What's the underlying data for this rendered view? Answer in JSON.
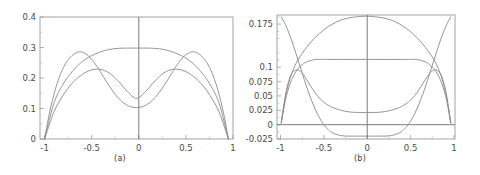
{
  "figure": {
    "background": "#ffffff",
    "panels": [
      {
        "caption": "(a)",
        "chart_data": {
          "type": "line",
          "title": "",
          "xlabel": "",
          "ylabel": "",
          "xlim": [
            -1.05,
            1.05
          ],
          "ylim": [
            0,
            0.42
          ],
          "xticks": [
            -1,
            -0.5,
            0,
            0.5,
            1
          ],
          "xtick_labels": [
            "-1",
            "-0.5",
            "0",
            "0.5",
            "1"
          ],
          "yticks": [
            0,
            0.1,
            0.2,
            0.3,
            0.4
          ],
          "ytick_labels": [
            "0",
            "0.1",
            "0.2",
            "0.3",
            "0.4"
          ],
          "grid": false,
          "legend": "none",
          "frame": true,
          "zero_axis_vertical": true,
          "series": [
            {
              "name": "single-peak dome",
              "color": "#8a8a8a",
              "x": [
                -1,
                -0.9,
                -0.8,
                -0.7,
                -0.6,
                -0.5,
                -0.4,
                -0.3,
                -0.2,
                -0.1,
                0,
                0.1,
                0.2,
                0.3,
                0.4,
                0.5,
                0.6,
                0.7,
                0.8,
                0.9,
                1
              ],
              "y": [
                0,
                0.122,
                0.188,
                0.232,
                0.264,
                0.285,
                0.299,
                0.308,
                0.312,
                0.313,
                0.313,
                0.313,
                0.312,
                0.308,
                0.299,
                0.285,
                0.264,
                0.232,
                0.188,
                0.122,
                0
              ]
            },
            {
              "name": "center-dip curve",
              "color": "#8a8a8a",
              "x": [
                -1,
                -0.9,
                -0.8,
                -0.7,
                -0.6,
                -0.5,
                -0.4,
                -0.3,
                -0.2,
                -0.1,
                0,
                0.1,
                0.2,
                0.3,
                0.4,
                0.5,
                0.6,
                0.7,
                0.8,
                0.9,
                1
              ],
              "y": [
                0,
                0.092,
                0.15,
                0.192,
                0.22,
                0.237,
                0.24,
                0.228,
                0.2,
                0.164,
                0.14,
                0.164,
                0.2,
                0.228,
                0.24,
                0.237,
                0.22,
                0.192,
                0.15,
                0.092,
                0
              ]
            },
            {
              "name": "double-peak curve",
              "color": "#8a8a8a",
              "x": [
                -1,
                -0.95,
                -0.9,
                -0.85,
                -0.8,
                -0.75,
                -0.7,
                -0.65,
                -0.62,
                -0.6,
                -0.55,
                -0.5,
                -0.45,
                -0.4,
                -0.3,
                -0.2,
                -0.1,
                0,
                0.1,
                0.2,
                0.3,
                0.4,
                0.45,
                0.5,
                0.55,
                0.6,
                0.62,
                0.65,
                0.7,
                0.75,
                0.8,
                0.85,
                0.9,
                0.95,
                1
              ],
              "y": [
                0,
                0.085,
                0.152,
                0.204,
                0.243,
                0.27,
                0.288,
                0.298,
                0.3,
                0.3,
                0.293,
                0.279,
                0.259,
                0.235,
                0.184,
                0.142,
                0.116,
                0.108,
                0.116,
                0.142,
                0.184,
                0.235,
                0.259,
                0.279,
                0.293,
                0.3,
                0.3,
                0.298,
                0.288,
                0.27,
                0.243,
                0.204,
                0.152,
                0.085,
                0
              ]
            }
          ]
        }
      },
      {
        "caption": "(b)",
        "chart_data": {
          "type": "line",
          "title": "",
          "xlabel": "",
          "ylabel": "",
          "xlim": [
            -1.05,
            1.05
          ],
          "ylim": [
            -0.028,
            0.187
          ],
          "xticks": [
            -1,
            -0.5,
            0,
            0.5,
            1
          ],
          "xtick_labels": [
            "-1",
            "-0.5",
            "0",
            "0.5",
            "1"
          ],
          "yticks": [
            -0.025,
            0,
            0.025,
            0.05,
            0.075,
            0.1,
            0.175
          ],
          "ytick_labels": [
            "-0.025",
            "0",
            "0.025",
            "0.05",
            "0.075",
            "0.1",
            "0.175"
          ],
          "grid": false,
          "legend": "none",
          "frame": true,
          "zero_axis_vertical": true,
          "zero_axis_horizontal": true,
          "series": [
            {
              "name": "tall dome",
              "color": "#8a8a8a",
              "x": [
                -1,
                -0.95,
                -0.9,
                -0.85,
                -0.8,
                -0.7,
                -0.6,
                -0.5,
                -0.4,
                -0.3,
                -0.2,
                -0.1,
                0,
                0.1,
                0.2,
                0.3,
                0.4,
                0.5,
                0.6,
                0.7,
                0.8,
                0.85,
                0.9,
                0.95,
                1
              ],
              "y": [
                0,
                0.045,
                0.075,
                0.095,
                0.11,
                0.131,
                0.148,
                0.161,
                0.171,
                0.178,
                0.182,
                0.184,
                0.185,
                0.184,
                0.182,
                0.178,
                0.171,
                0.161,
                0.148,
                0.131,
                0.11,
                0.095,
                0.075,
                0.045,
                0
              ]
            },
            {
              "name": "flat-top plateau",
              "color": "#8a8a8a",
              "x": [
                -1,
                -0.95,
                -0.9,
                -0.85,
                -0.8,
                -0.75,
                -0.7,
                -0.65,
                -0.6,
                -0.55,
                -0.5,
                -0.4,
                -0.3,
                -0.2,
                -0.1,
                0,
                0.1,
                0.2,
                0.3,
                0.4,
                0.5,
                0.55,
                0.6,
                0.65,
                0.7,
                0.75,
                0.8,
                0.85,
                0.9,
                0.95,
                1
              ],
              "y": [
                0,
                0.04,
                0.066,
                0.083,
                0.094,
                0.101,
                0.106,
                0.108,
                0.11,
                0.11,
                0.11,
                0.11,
                0.11,
                0.11,
                0.11,
                0.11,
                0.11,
                0.11,
                0.11,
                0.11,
                0.11,
                0.11,
                0.11,
                0.108,
                0.106,
                0.101,
                0.094,
                0.083,
                0.066,
                0.04,
                0
              ]
            },
            {
              "name": "double-peak curve",
              "color": "#8a8a8a",
              "x": [
                -1,
                -0.97,
                -0.94,
                -0.9,
                -0.87,
                -0.84,
                -0.81,
                -0.78,
                -0.75,
                -0.7,
                -0.65,
                -0.6,
                -0.55,
                -0.5,
                -0.45,
                -0.4,
                -0.3,
                -0.2,
                -0.1,
                0,
                0.1,
                0.2,
                0.3,
                0.4,
                0.45,
                0.5,
                0.55,
                0.6,
                0.65,
                0.7,
                0.75,
                0.78,
                0.81,
                0.84,
                0.87,
                0.9,
                0.94,
                0.97,
                1
              ],
              "y": [
                0,
                0.03,
                0.056,
                0.078,
                0.087,
                0.091,
                0.092,
                0.09,
                0.086,
                0.075,
                0.063,
                0.052,
                0.043,
                0.036,
                0.031,
                0.027,
                0.022,
                0.019,
                0.018,
                0.018,
                0.018,
                0.019,
                0.022,
                0.027,
                0.031,
                0.036,
                0.043,
                0.052,
                0.063,
                0.075,
                0.086,
                0.09,
                0.092,
                0.091,
                0.087,
                0.078,
                0.056,
                0.03,
                0
              ]
            },
            {
              "name": "below-zero basin",
              "color": "#8a8a8a",
              "x": [
                -1,
                -0.95,
                -0.9,
                -0.85,
                -0.8,
                -0.75,
                -0.7,
                -0.65,
                -0.6,
                -0.55,
                -0.5,
                -0.45,
                -0.4,
                -0.3,
                -0.2,
                -0.1,
                0,
                0.1,
                0.2,
                0.3,
                0.4,
                0.45,
                0.5,
                0.55,
                0.6,
                0.65,
                0.7,
                0.75,
                0.8,
                0.85,
                0.9,
                0.95,
                1
              ],
              "y": [
                0.184,
                0.17,
                0.152,
                0.131,
                0.108,
                0.085,
                0.062,
                0.042,
                0.024,
                0.009,
                -0.003,
                -0.011,
                -0.017,
                -0.022,
                -0.023,
                -0.023,
                -0.023,
                -0.023,
                -0.023,
                -0.022,
                -0.017,
                -0.011,
                -0.003,
                0.009,
                0.024,
                0.042,
                0.062,
                0.085,
                0.108,
                0.131,
                0.152,
                0.17,
                0.184
              ]
            }
          ]
        }
      }
    ]
  }
}
